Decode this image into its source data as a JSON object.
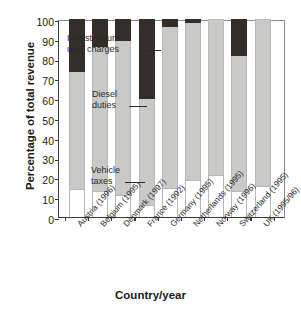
{
  "chart_data": {
    "type": "bar",
    "title": "",
    "subtitle": "",
    "stacked": true,
    "xlabel": "Country/year",
    "ylabel": "Percentage of total revenue",
    "ylim": [
      0,
      100
    ],
    "ytick_labels": [
      "100",
      "90",
      "80",
      "70",
      "60",
      "50",
      "40",
      "30",
      "20",
      "10",
      "0"
    ],
    "ytick_values": [
      100,
      90,
      80,
      70,
      60,
      50,
      40,
      30,
      20,
      10,
      0
    ],
    "grid": false,
    "legend_position": "in-plot-annotations",
    "categories": [
      "Austria (1996)",
      "Belgium (1995)",
      "Denmark (1997)",
      "France (1992)",
      "Germany (1995)",
      "Netherlands (1995)",
      "Norway (1996)",
      "Switzerland (1995)",
      "UK (1995/96)"
    ],
    "series": [
      {
        "name": "Vehicle taxes",
        "color": "#ffffff",
        "values": [
          14,
          13,
          11,
          6,
          14.5,
          18.5,
          21,
          13,
          15.5
        ]
      },
      {
        "name": "Diesel duties",
        "color": "#c9c9c7",
        "values": [
          59,
          73,
          78,
          53.5,
          81.5,
          79.5,
          79,
          68.5,
          84.5
        ]
      },
      {
        "name": "Infrastructures user charges",
        "color": "#332f28",
        "values": [
          27,
          14,
          11,
          40.5,
          4,
          2,
          0,
          18.5,
          0
        ]
      }
    ],
    "annotations": [
      {
        "id": "infra",
        "text_line1": "Infrastructures",
        "text_line2": "user charges"
      },
      {
        "id": "diesel",
        "text_line1": "Diesel",
        "text_line2": "duties"
      },
      {
        "id": "vehicle",
        "text_line1": "Vehicle",
        "text_line2": "taxes"
      }
    ]
  }
}
